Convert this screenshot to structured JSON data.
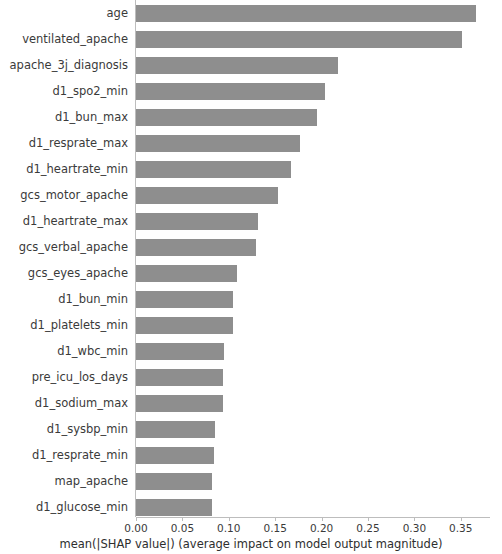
{
  "chart_data": {
    "type": "bar",
    "orientation": "horizontal",
    "title": "",
    "xlabel": "mean(|SHAP value|) (average impact on model output magnitude)",
    "ylabel": "",
    "xlim": [
      0.0,
      0.38
    ],
    "grid": false,
    "legend": null,
    "bar_color": "#8e8e8e",
    "xticks": [
      "0.00",
      "0.05",
      "0.10",
      "0.15",
      "0.20",
      "0.25",
      "0.30",
      "0.35"
    ],
    "xtick_values": [
      0.0,
      0.05,
      0.1,
      0.15,
      0.2,
      0.25,
      0.3,
      0.35
    ],
    "categories": [
      "age",
      "ventilated_apache",
      "apache_3j_diagnosis",
      "d1_spo2_min",
      "d1_bun_max",
      "d1_resprate_max",
      "d1_heartrate_min",
      "gcs_motor_apache",
      "d1_heartrate_max",
      "gcs_verbal_apache",
      "gcs_eyes_apache",
      "d1_bun_min",
      "d1_platelets_min",
      "d1_wbc_min",
      "pre_icu_los_days",
      "d1_sodium_max",
      "d1_sysbp_min",
      "d1_resprate_min",
      "map_apache",
      "d1_glucose_min"
    ],
    "values": [
      0.366,
      0.351,
      0.218,
      0.204,
      0.195,
      0.177,
      0.167,
      0.153,
      0.131,
      0.129,
      0.109,
      0.105,
      0.105,
      0.095,
      0.094,
      0.094,
      0.085,
      0.084,
      0.082,
      0.082
    ]
  },
  "axis": {
    "x_title": "mean(|SHAP value|) (average impact on model output magnitude)"
  }
}
